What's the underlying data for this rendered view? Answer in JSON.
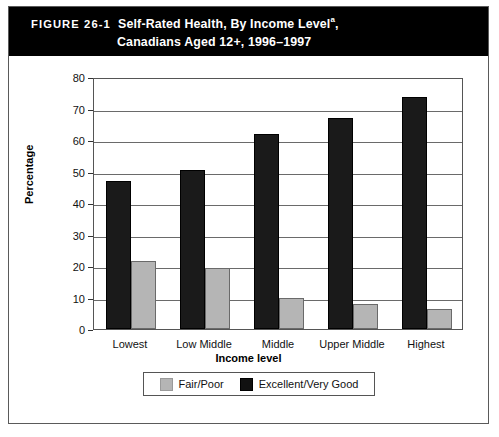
{
  "figure": {
    "label": "FIGURE 26-1",
    "title_line1": "Self-Rated Health, By Income Level",
    "title_superscript": "a",
    "title_line1_suffix": ",",
    "title_line2": "Canadians Aged 12+, 1996–1997"
  },
  "colors": {
    "header_background": "#000000",
    "header_text": "#ffffff",
    "series_excellent": "#1a1a1a",
    "series_fair": "#b5b5b5",
    "frame": "#555555",
    "gridline": "#6a6a6a"
  },
  "chart_data": {
    "type": "bar",
    "xlabel": "Income level",
    "ylabel": "Percentage",
    "categories": [
      "Lowest",
      "Low Middle",
      "Middle",
      "Upper Middle",
      "Highest"
    ],
    "series": [
      {
        "name": "Excellent/Very Good",
        "color": "#1a1a1a",
        "values": [
          47,
          50.5,
          62,
          67,
          73.5
        ]
      },
      {
        "name": "Fair/Poor",
        "color": "#b5b5b5",
        "values": [
          21.5,
          19.3,
          10,
          8,
          6.5
        ]
      }
    ],
    "ylim": [
      0,
      80
    ],
    "yticks": [
      0,
      10,
      20,
      30,
      40,
      50,
      60,
      70,
      80
    ],
    "grid": true,
    "legend_position": "bottom",
    "legend_entries": [
      "Fair/Poor",
      "Excellent/Very Good"
    ],
    "bar_order": [
      "Excellent/Very Good",
      "Fair/Poor"
    ]
  }
}
